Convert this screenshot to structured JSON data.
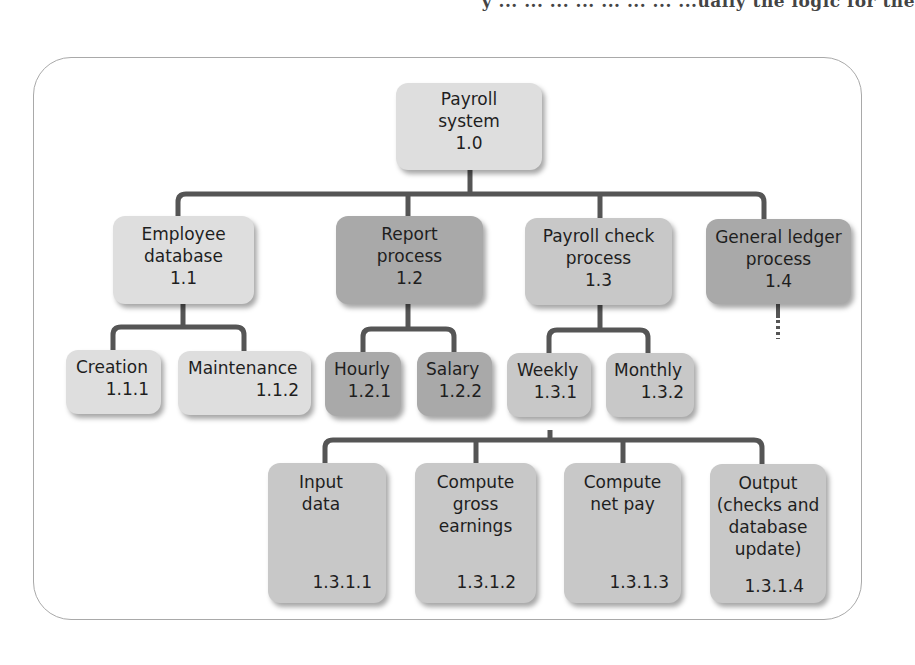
{
  "page": {
    "top_text_fragment": "y ... ... ... ... ... ... ... ...ually the logic for the"
  },
  "diagram": {
    "colors": {
      "light": "#dedede",
      "mid": "#c8c8c8",
      "dark": "#a9a9a9",
      "line": "#555555",
      "frame": "#a9a9a9"
    },
    "root": {
      "label": "Payroll system",
      "num": "1.0"
    },
    "level1": [
      {
        "label": "Employee database",
        "num": "1.1"
      },
      {
        "label": "Report process",
        "num": "1.2"
      },
      {
        "label": "Payroll check process",
        "num": "1.3"
      },
      {
        "label": "General ledger process",
        "num": "1.4"
      }
    ],
    "level2": [
      {
        "label": "Creation",
        "num": "1.1.1"
      },
      {
        "label": "Maintenance",
        "num": "1.1.2"
      },
      {
        "label": "Hourly",
        "num": "1.2.1"
      },
      {
        "label": "Salary",
        "num": "1.2.2"
      },
      {
        "label": "Weekly",
        "num": "1.3.1"
      },
      {
        "label": "Monthly",
        "num": "1.3.2"
      }
    ],
    "level3": [
      {
        "label": "Input data",
        "num": "1.3.1.1"
      },
      {
        "label": "Compute gross earnings",
        "num": "1.3.1.2"
      },
      {
        "label": "Compute net pay",
        "num": "1.3.1.3"
      },
      {
        "label": "Output (checks and database update)",
        "num": "1.3.1.4"
      }
    ],
    "continuation_marker": "dashed line below 1.4"
  }
}
